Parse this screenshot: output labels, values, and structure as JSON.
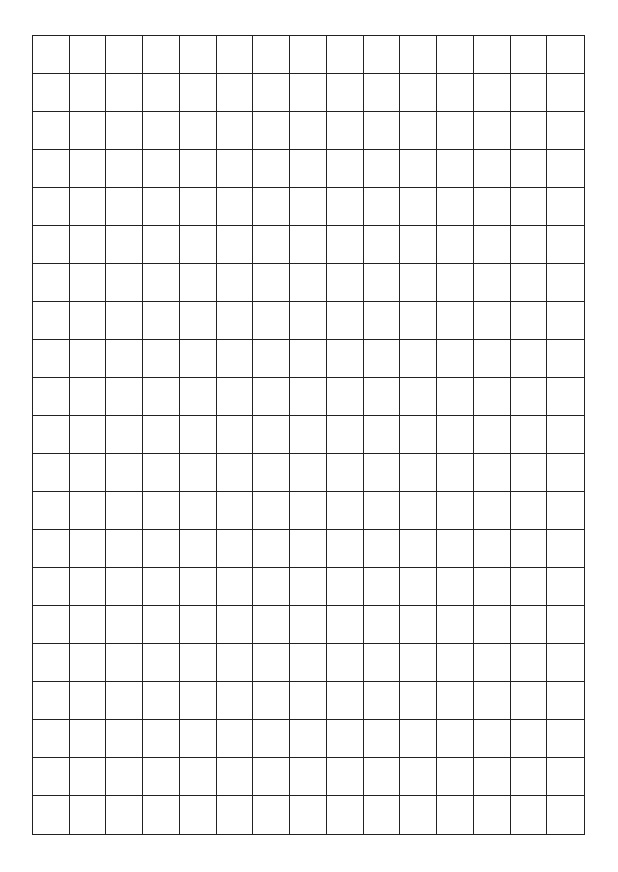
{
  "page": {
    "top_fragment": "˙",
    "grid": {
      "columns": 15,
      "rows": 21,
      "line_color": "#222222",
      "background": "#ffffff"
    }
  }
}
